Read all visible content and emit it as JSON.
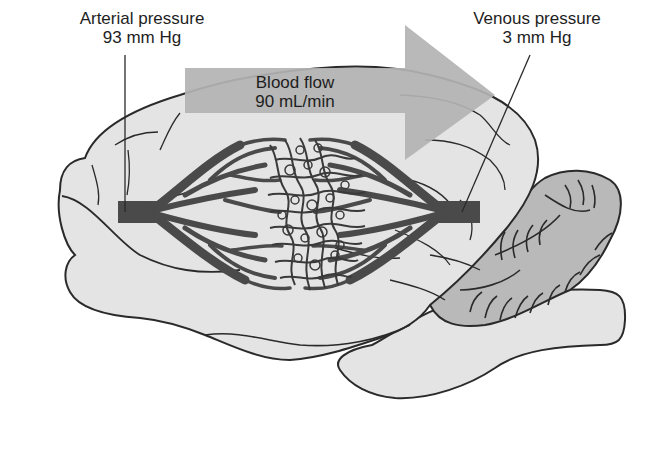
{
  "figure": {
    "type": "anatomical-diagram"
  },
  "labels": {
    "arterial": {
      "title": "Arterial pressure",
      "value": "93 mm Hg"
    },
    "venous": {
      "title": "Venous pressure",
      "value": "3 mm Hg"
    },
    "flow": {
      "title": "Blood flow",
      "value": "90 mL/min"
    }
  },
  "colors": {
    "background": "#ffffff",
    "brain_fill": "#e4e4e4",
    "cerebellum_fill": "#b9b9b9",
    "vessel": "#4a4a4a",
    "arrow": "#b3b3b3",
    "outline": "#2a2a2a",
    "text": "#1e1e1e"
  }
}
